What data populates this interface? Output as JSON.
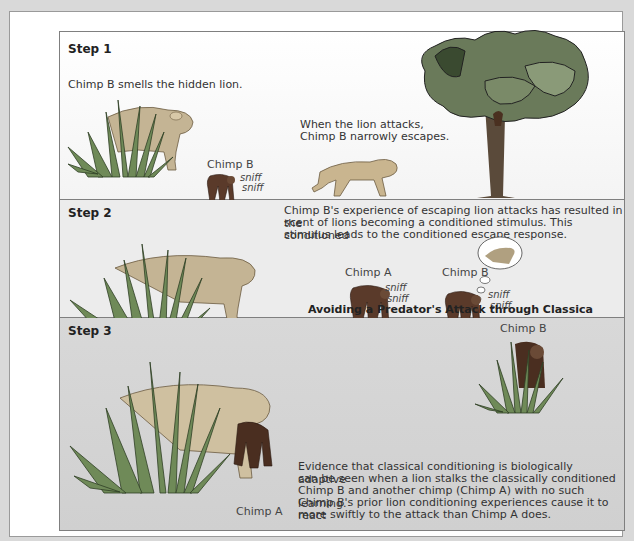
{
  "figure": {
    "caption": "Avoiding a Predator's Attack through Classica",
    "steps": [
      {
        "label": "Step 1",
        "text_left": "Chimp B smells the hidden lion.",
        "text_right_line1": "When the lion attacks,",
        "text_right_line2": "Chimp B narrowly escapes.",
        "chimp_label": "Chimp B",
        "sniff1": "sniff",
        "sniff2": "sniff"
      },
      {
        "label": "Step 2",
        "text_line1": "Chimp B's experience of escaping lion attacks has resulted in the",
        "text_line2": "scent of lions becoming a conditioned stimulus. This conditioned",
        "text_line3": "stimulus leads to the conditioned escape response.",
        "chimp_a_label": "Chimp A",
        "chimp_b_label": "Chimp B",
        "sniff1": "sniff",
        "sniff2": "sniff"
      },
      {
        "label": "Step 3",
        "chimp_b_label": "Chimp B",
        "chimp_a_label": "Chimp A",
        "text_line1": "Evidence that classical conditioning is biologically adaptive",
        "text_line2": "can be seen when a lion stalks the classically conditioned",
        "text_line3": "Chimp B and another chimp (Chimp A) with no such learning.",
        "text_line4": "Chimp B's prior lion conditioning experiences cause it to react",
        "text_line5": "more swiftly to the attack than Chimp A does."
      }
    ]
  },
  "colors": {
    "page_bg": "#d9d9d9",
    "panel1_bg": "#f8f8f8",
    "panel2_bg": "#ececec",
    "panel3_bg": "#d4d4d4",
    "border": "#7f7f7f"
  }
}
